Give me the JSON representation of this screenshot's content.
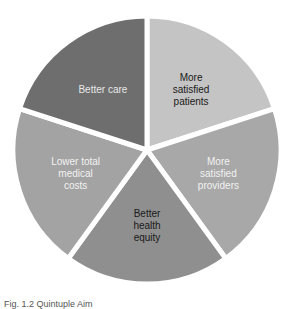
{
  "chart_data": {
    "type": "pie",
    "title": "",
    "categories": [
      "More satisfied patients",
      "More satisfied providers",
      "Better health equity",
      "Lower total medical costs",
      "Better care"
    ],
    "values": [
      20,
      20,
      20,
      20,
      20
    ],
    "colors": [
      "#c4c4c4",
      "#a8a8a8",
      "#8f8f8f",
      "#a3a3a3",
      "#6e6e6e"
    ],
    "label_colors": [
      "#1a1a1a",
      "#f2f2f2",
      "#1a1a1a",
      "#f2f2f2",
      "#e8e8e8"
    ],
    "start_angle_deg": 0,
    "direction": "clockwise",
    "legend": "none",
    "slice_labels": [
      [
        "More",
        "satisfied",
        "patients"
      ],
      [
        "More",
        "satisfied",
        "providers"
      ],
      [
        "Better",
        "health",
        "equity"
      ],
      [
        "Lower total",
        "medical",
        "costs"
      ],
      [
        "Better care"
      ]
    ]
  },
  "caption": "Fig. 1.2 Quintuple Aim"
}
